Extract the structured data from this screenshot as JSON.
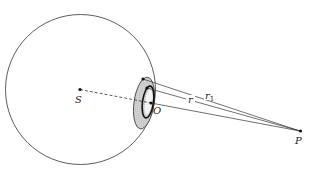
{
  "diagram": {
    "labels": {
      "S": "S",
      "O": "O",
      "P": "P",
      "r": "r",
      "r1": "r",
      "r1_sub": "1"
    },
    "colors": {
      "stroke": "#333333",
      "shade": "#cfcfcf",
      "background": "#ffffff"
    }
  }
}
